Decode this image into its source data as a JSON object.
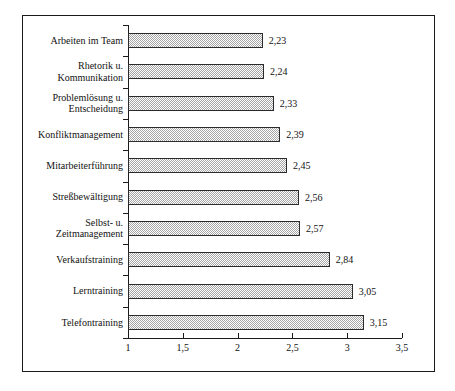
{
  "chart_data": {
    "type": "bar",
    "orientation": "horizontal",
    "title": "",
    "subtitle": "",
    "xlabel": "",
    "ylabel": "",
    "xlim": [
      1,
      3.5
    ],
    "xticks": [
      "1",
      "1,5",
      "2",
      "2,5",
      "3",
      "3,5"
    ],
    "xtick_values": [
      1,
      1.5,
      2,
      2.5,
      3,
      3.5
    ],
    "grid": false,
    "legend": false,
    "decimal_separator": ",",
    "bar_fill": "#a6a6a6",
    "bar_edge": "#2b2b2b",
    "frame_color": "#1a1a1a",
    "background": "#ffffff",
    "categories": [
      "Arbeiten im Team",
      "Rhetorik u. Kommunikation",
      "Problemlösung u. Entscheidung",
      "Konfliktmanagement",
      "Mitarbeiterführung",
      "Streßbewältigung",
      "Selbst- u. Zeitmanagement",
      "Verkaufstraining",
      "Lerntraining",
      "Telefontraining"
    ],
    "values": [
      2.23,
      2.24,
      2.33,
      2.39,
      2.45,
      2.56,
      2.57,
      2.84,
      3.05,
      3.15
    ],
    "value_labels": [
      "2,23",
      "2,24",
      "2,33",
      "2,39",
      "2,45",
      "2,56",
      "2,57",
      "2,84",
      "3,05",
      "3,15"
    ],
    "category_lines": [
      [
        "Arbeiten im Team"
      ],
      [
        "Rhetorik u.",
        "Kommunikation"
      ],
      [
        "Problemlösung u.",
        "Entscheidung"
      ],
      [
        "Konfliktmanagement"
      ],
      [
        "Mitarbeiterführung"
      ],
      [
        "Streßbewältigung"
      ],
      [
        "Selbst- u.",
        "Zeitmanagement"
      ],
      [
        "Verkaufstraining"
      ],
      [
        "Lerntraining"
      ],
      [
        "Telefontraining"
      ]
    ]
  }
}
